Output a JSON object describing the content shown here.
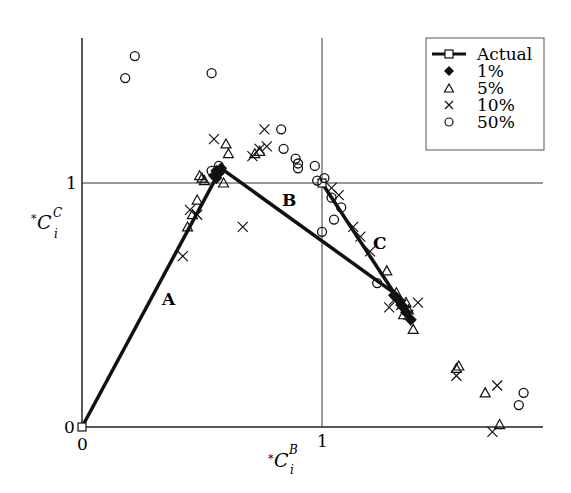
{
  "chart_data": {
    "type": "scatter",
    "title": "",
    "xlabel": "*C_i^B",
    "ylabel": "*C_i^C",
    "xlim": [
      0,
      1.9
    ],
    "ylim": [
      0,
      1.6
    ],
    "x_ticks": [
      "0",
      "1"
    ],
    "y_ticks": [
      "0",
      "1"
    ],
    "grid": "reference lines at x=1 and y=1",
    "legend_position": "upper right",
    "legend": [
      "Actual",
      "1%",
      "5%",
      "10%",
      "50%"
    ],
    "segment_labels": [
      {
        "text": "A",
        "x": 0.37,
        "y": 0.52
      },
      {
        "text": "B",
        "x": 0.87,
        "y": 0.93
      },
      {
        "text": "C",
        "x": 1.25,
        "y": 0.74
      }
    ],
    "series": [
      {
        "name": "Actual",
        "marker": "open-square-line",
        "paths": [
          [
            [
              0,
              0
            ],
            [
              0.58,
              1.06
            ],
            [
              1.3,
              0.55
            ]
          ],
          [
            [
              1.0,
              1.0
            ],
            [
              1.38,
              0.43
            ]
          ]
        ]
      },
      {
        "name": "1%",
        "marker": "filled-diamond",
        "points": [
          [
            0.55,
            1.03
          ],
          [
            0.56,
            1.05
          ],
          [
            0.57,
            1.04
          ],
          [
            0.58,
            1.06
          ],
          [
            0.56,
            1.02
          ],
          [
            1.3,
            0.54
          ],
          [
            1.32,
            0.52
          ],
          [
            1.33,
            0.5
          ],
          [
            1.34,
            0.49
          ],
          [
            1.35,
            0.47
          ],
          [
            1.37,
            0.44
          ],
          [
            1.31,
            0.53
          ]
        ]
      },
      {
        "name": "5%",
        "marker": "open-triangle",
        "points": [
          [
            0.49,
            1.03
          ],
          [
            0.5,
            1.02
          ],
          [
            0.51,
            1.01
          ],
          [
            0.6,
            1.16
          ],
          [
            0.61,
            1.12
          ],
          [
            0.59,
            1.0
          ],
          [
            0.46,
            0.87
          ],
          [
            0.48,
            0.93
          ],
          [
            0.44,
            0.82
          ],
          [
            0.72,
            1.12
          ],
          [
            0.74,
            1.13
          ],
          [
            1.27,
            0.64
          ],
          [
            1.31,
            0.55
          ],
          [
            1.34,
            0.46
          ],
          [
            1.36,
            0.48
          ],
          [
            1.38,
            0.4
          ],
          [
            1.35,
            0.51
          ],
          [
            1.57,
            0.25
          ],
          [
            1.68,
            0.14
          ],
          [
            1.74,
            0.01
          ],
          [
            1.56,
            0.24
          ]
        ]
      },
      {
        "name": "10%",
        "marker": "x",
        "points": [
          [
            0.55,
            1.18
          ],
          [
            0.76,
            1.22
          ],
          [
            0.74,
            1.14
          ],
          [
            0.77,
            1.15
          ],
          [
            0.71,
            1.11
          ],
          [
            0.45,
            0.89
          ],
          [
            0.48,
            0.87
          ],
          [
            0.42,
            0.7
          ],
          [
            0.67,
            0.82
          ],
          [
            1.04,
            0.98
          ],
          [
            1.07,
            0.95
          ],
          [
            1.13,
            0.82
          ],
          [
            1.16,
            0.78
          ],
          [
            1.2,
            0.72
          ],
          [
            1.3,
            0.52
          ],
          [
            1.33,
            0.5
          ],
          [
            1.28,
            0.49
          ],
          [
            1.4,
            0.51
          ],
          [
            1.36,
            0.46
          ],
          [
            1.56,
            0.21
          ],
          [
            1.73,
            0.17
          ],
          [
            1.71,
            -0.02
          ]
        ]
      },
      {
        "name": "50%",
        "marker": "open-circle",
        "points": [
          [
            0.22,
            1.52
          ],
          [
            0.18,
            1.43
          ],
          [
            0.54,
            1.45
          ],
          [
            0.83,
            1.22
          ],
          [
            0.84,
            1.14
          ],
          [
            0.89,
            1.1
          ],
          [
            0.9,
            1.06
          ],
          [
            0.9,
            1.08
          ],
          [
            0.97,
            1.07
          ],
          [
            0.98,
            1.01
          ],
          [
            1.01,
            1.02
          ],
          [
            1.04,
            0.94
          ],
          [
            1.08,
            0.9
          ],
          [
            1.05,
            0.85
          ],
          [
            1.0,
            0.8
          ],
          [
            1.23,
            0.59
          ],
          [
            0.54,
            1.05
          ],
          [
            0.57,
            1.07
          ],
          [
            1.84,
            0.14
          ],
          [
            1.82,
            0.09
          ]
        ]
      }
    ]
  },
  "axes": {
    "x_tick_labels": [
      "0",
      "1"
    ],
    "y_tick_labels": [
      "0",
      "1"
    ],
    "x_label_prefix": "*",
    "x_label_main": "C",
    "x_label_sup": "B",
    "x_label_sub": "i",
    "y_label_prefix": "*",
    "y_label_main": "C",
    "y_label_sup": "C",
    "y_label_sub": "i"
  },
  "legend": {
    "items": [
      {
        "label": "Actual"
      },
      {
        "label": "1%"
      },
      {
        "label": "5%"
      },
      {
        "label": "10%"
      },
      {
        "label": "50%"
      }
    ]
  },
  "segments": {
    "a": "A",
    "b": "B",
    "c": "C"
  }
}
